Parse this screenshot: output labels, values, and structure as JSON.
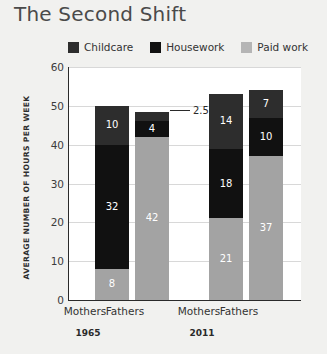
{
  "chart_data": {
    "type": "bar",
    "subtype": "stacked",
    "title": "The Second Shift",
    "xlabel": "",
    "ylabel": "AVERAGE NUMBER OF HOURS PER WEEK",
    "ylim": [
      0,
      60
    ],
    "ytick_labels": [
      "60",
      "50",
      "40",
      "30",
      "20",
      "10",
      "0"
    ],
    "ytick_values": [
      60,
      50,
      40,
      30,
      20,
      10,
      0
    ],
    "grid": true,
    "legend_position": "top",
    "groups": [
      {
        "label": "1965",
        "categories": [
          "Mothers",
          "Fathers"
        ]
      },
      {
        "label": "2011",
        "categories": [
          "Mothers",
          "Fathers"
        ]
      }
    ],
    "categories": [
      "Mothers",
      "Fathers",
      "Mothers",
      "Fathers"
    ],
    "series": [
      {
        "name": "Paid work",
        "color": "#a3a3a3",
        "values": [
          8,
          42,
          21,
          37
        ]
      },
      {
        "name": "Housework",
        "color": "#111111",
        "values": [
          32,
          4,
          18,
          10
        ]
      },
      {
        "name": "Childcare",
        "color": "#2d2d2d",
        "values": [
          10,
          2.5,
          14,
          7
        ]
      }
    ],
    "totals": [
      50,
      48.5,
      53,
      54
    ],
    "annotations": [
      {
        "text": "2.5",
        "series": "Childcare",
        "category_index": 1,
        "group": "1965",
        "style": "leader-line"
      }
    ]
  },
  "legend": {
    "items": [
      {
        "label": "Childcare",
        "color": "#2d2d2d"
      },
      {
        "label": "Housework",
        "color": "#111111"
      },
      {
        "label": "Paid work",
        "color": "#b5b5b5"
      }
    ]
  },
  "bars": [
    {
      "name": "mothers-1965",
      "x": 26,
      "category": "Mothers",
      "group": "1965",
      "segments": [
        {
          "series": "Paid work",
          "value": 8,
          "label": "8",
          "color": "#a3a3a3",
          "label_color": "#ffffff"
        },
        {
          "series": "Housework",
          "value": 32,
          "label": "32",
          "color": "#111111",
          "label_color": "#ffffff"
        },
        {
          "series": "Childcare",
          "value": 10,
          "label": "10",
          "color": "#2d2d2d",
          "label_color": "#ffffff"
        }
      ]
    },
    {
      "name": "fathers-1965",
      "x": 66,
      "category": "Fathers",
      "group": "1965",
      "segments": [
        {
          "series": "Paid work",
          "value": 42,
          "label": "42",
          "color": "#a3a3a3",
          "label_color": "#ffffff"
        },
        {
          "series": "Housework",
          "value": 4,
          "label": "4",
          "color": "#111111",
          "label_color": "#ffffff"
        },
        {
          "series": "Childcare",
          "value": 2.5,
          "label": "",
          "color": "#2d2d2d",
          "label_color": "#ffffff"
        }
      ]
    },
    {
      "name": "mothers-2011",
      "x": 140,
      "category": "Mothers",
      "group": "2011",
      "segments": [
        {
          "series": "Paid work",
          "value": 21,
          "label": "21",
          "color": "#a3a3a3",
          "label_color": "#ffffff"
        },
        {
          "series": "Housework",
          "value": 18,
          "label": "18",
          "color": "#111111",
          "label_color": "#ffffff"
        },
        {
          "series": "Childcare",
          "value": 14,
          "label": "14",
          "color": "#2d2d2d",
          "label_color": "#ffffff"
        }
      ]
    },
    {
      "name": "fathers-2011",
      "x": 180,
      "category": "Fathers",
      "group": "2011",
      "segments": [
        {
          "series": "Paid work",
          "value": 37,
          "label": "37",
          "color": "#a3a3a3",
          "label_color": "#ffffff"
        },
        {
          "series": "Housework",
          "value": 10,
          "label": "10",
          "color": "#111111",
          "label_color": "#ffffff"
        },
        {
          "series": "Childcare",
          "value": 7,
          "label": "7",
          "color": "#2d2d2d",
          "label_color": "#ffffff"
        }
      ]
    }
  ],
  "callout": {
    "label": "2.5"
  },
  "x_axis": {
    "category_labels": [
      "Mothers",
      "Fathers",
      "Mothers",
      "Fathers"
    ],
    "category_positions": [
      68,
      108,
      182,
      222
    ],
    "group_labels": [
      "1965",
      "2011"
    ],
    "group_positions": [
      88,
      202
    ]
  },
  "colors": {
    "background": "#f1f1ef",
    "plot_background": "#ffffff",
    "axis": "#2a2a2a",
    "grid": "#d8d8d8",
    "childcare": "#2d2d2d",
    "housework": "#111111",
    "paid_work": "#a3a3a3"
  }
}
